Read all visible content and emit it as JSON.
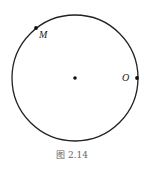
{
  "figure": {
    "caption": "图 2.14",
    "circle": {
      "center_point": true
    },
    "points": [
      {
        "name": "M",
        "label": "M",
        "angle_deg": 128
      },
      {
        "name": "O",
        "label": "O",
        "angle_deg": 0
      }
    ]
  }
}
